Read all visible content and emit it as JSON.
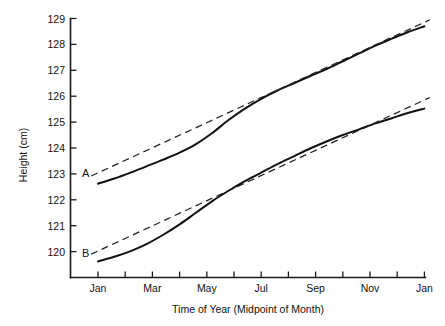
{
  "chart_data": {
    "type": "line",
    "title": "",
    "xlabel": "Time of Year (Midpoint of Month)",
    "ylabel": "Height (cm)",
    "ylim": [
      119,
      129
    ],
    "xlim": [
      0,
      26
    ],
    "grid": false,
    "legend_position": "inline-labels",
    "y_ticks": [
      119,
      120,
      121,
      122,
      123,
      124,
      125,
      126,
      127,
      128,
      129
    ],
    "y_tick_labels": [
      "",
      "120",
      "121",
      "122",
      "123",
      "124",
      "125",
      "126",
      "127",
      "128",
      "129"
    ],
    "x_ticks": [
      2,
      3,
      4,
      5,
      6,
      7,
      8,
      9,
      10,
      11,
      12,
      13,
      14
    ],
    "x_tick_labels": [
      "Jan",
      "",
      "Mar",
      "",
      "May",
      "",
      "Jul",
      "",
      "Sep",
      "",
      "Nov",
      "",
      "Jan"
    ],
    "x_major_labels": [
      "Jan",
      "Mar",
      "May",
      "Jul",
      "Sep",
      "Nov",
      "Jan"
    ],
    "annotations": [
      {
        "text": "A",
        "x": 1.55,
        "y": 123.05,
        "series": "A"
      },
      {
        "text": "B",
        "x": 1.55,
        "y": 119.95,
        "series": "B"
      }
    ],
    "series": [
      {
        "name": "A",
        "style": "solid",
        "label": "A",
        "x": [
          2.0,
          2.6,
          3.2,
          3.8,
          4.4,
          5.0,
          5.6,
          6.2,
          6.8,
          7.4,
          8.0,
          8.6,
          9.2,
          9.8,
          10.4,
          11.0,
          11.6,
          12.2,
          12.8,
          13.4,
          14.0
        ],
        "y": [
          122.62,
          122.82,
          123.05,
          123.3,
          123.55,
          123.82,
          124.15,
          124.58,
          125.08,
          125.52,
          125.9,
          126.22,
          126.5,
          126.78,
          127.05,
          127.35,
          127.65,
          127.95,
          128.22,
          128.48,
          128.7
        ]
      },
      {
        "name": "A-trend",
        "style": "dashed",
        "label": "A (linear trend)",
        "x": [
          1.75,
          14.2
        ],
        "y": [
          122.92,
          128.95
        ]
      },
      {
        "name": "B",
        "style": "solid",
        "label": "B",
        "x": [
          2.0,
          2.6,
          3.2,
          3.8,
          4.4,
          5.0,
          5.6,
          6.2,
          6.8,
          7.4,
          8.0,
          8.6,
          9.2,
          9.8,
          10.4,
          11.0,
          11.6,
          12.2,
          12.8,
          13.4,
          14.0
        ],
        "y": [
          119.62,
          119.8,
          120.02,
          120.3,
          120.65,
          121.05,
          121.5,
          121.95,
          122.35,
          122.72,
          123.05,
          123.38,
          123.68,
          123.98,
          124.25,
          124.5,
          124.72,
          124.95,
          125.15,
          125.35,
          125.52
        ]
      },
      {
        "name": "B-trend",
        "style": "dashed",
        "label": "B (linear trend)",
        "x": [
          1.75,
          14.2
        ],
        "y": [
          119.9,
          125.95
        ]
      }
    ]
  },
  "axes": {
    "y_axis_title": "Height (cm)",
    "x_axis_title": "Time of Year (Midpoint of Month)"
  }
}
